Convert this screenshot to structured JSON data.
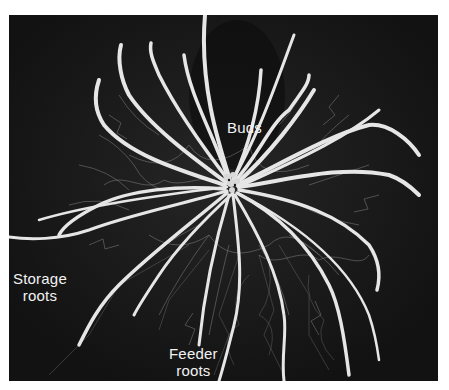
{
  "figure": {
    "background_color": "#141414",
    "root_color": "#e8e8e8",
    "labels": {
      "buds": "Buds",
      "storage_roots": [
        "Storage",
        "roots"
      ],
      "feeder_roots": [
        "Feeder",
        "roots"
      ]
    }
  }
}
